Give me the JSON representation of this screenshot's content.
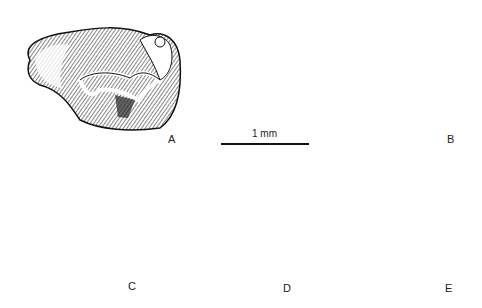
{
  "figure": {
    "scale_bar": {
      "label": "1 mm"
    },
    "specimens": [
      {
        "id": "A",
        "label": "A"
      },
      {
        "id": "B",
        "label": "B"
      },
      {
        "id": "C",
        "label": "C"
      },
      {
        "id": "D",
        "label": "D"
      },
      {
        "id": "E",
        "label": "E"
      }
    ]
  }
}
